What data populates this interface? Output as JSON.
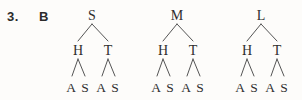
{
  "exercise": {
    "number": "3.",
    "part": "B"
  },
  "diagram": {
    "type": "tree-diagram",
    "tree_count": 3,
    "levels": 3,
    "ink_color": "#2e2e2e",
    "line_color": "#555555",
    "background_color": "#fdfcfa",
    "trees": [
      {
        "root": "S",
        "children": [
          {
            "label": "H",
            "children": [
              {
                "label": "A"
              },
              {
                "label": "S"
              }
            ]
          },
          {
            "label": "T",
            "children": [
              {
                "label": "A"
              },
              {
                "label": "S"
              }
            ]
          }
        ]
      },
      {
        "root": "M",
        "children": [
          {
            "label": "H",
            "children": [
              {
                "label": "A"
              },
              {
                "label": "S"
              }
            ]
          },
          {
            "label": "T",
            "children": [
              {
                "label": "A"
              },
              {
                "label": "S"
              }
            ]
          }
        ]
      },
      {
        "root": "L",
        "children": [
          {
            "label": "H",
            "children": [
              {
                "label": "A"
              },
              {
                "label": "S"
              }
            ]
          },
          {
            "label": "T",
            "children": [
              {
                "label": "A"
              },
              {
                "label": "S"
              }
            ]
          }
        ]
      }
    ]
  }
}
